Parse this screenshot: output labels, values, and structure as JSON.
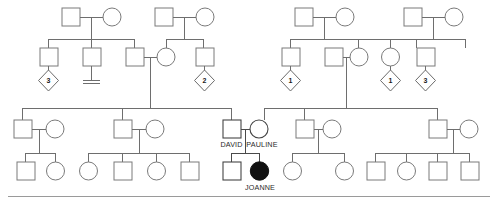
{
  "chart": {
    "type": "pedigree",
    "title": "",
    "width": 498,
    "height": 203,
    "background": "#ffffff",
    "line_color": "#6e6e6e",
    "shape_stroke": "#7a7a7a",
    "affected_fill": "#111111"
  },
  "legend_symbols": {
    "square": "male",
    "circle": "female",
    "diamond": "sibship-of-unspecified-sex",
    "filled_circle": "affected-female",
    "double_bar": "no-offspring"
  },
  "labels": {
    "david": "DAVID",
    "pauline": "PAULINE",
    "joanne": "JOANNE"
  },
  "diamond_counts": {
    "d1": "3",
    "d2": "2",
    "d3": "1",
    "d4": "1",
    "d5": "3"
  },
  "generations": [
    {
      "id": "generation-1",
      "label": "Generation I",
      "couples": [
        {
          "id": "couple-g1-a",
          "male": "square",
          "female": "circle"
        },
        {
          "id": "couple-g1-b",
          "male": "square",
          "female": "circle"
        },
        {
          "id": "couple-g1-c",
          "male": "square",
          "female": "circle"
        },
        {
          "id": "couple-g1-d",
          "male": "square",
          "female": "circle"
        }
      ]
    },
    {
      "id": "generation-2",
      "label": "Generation II",
      "members": [
        {
          "id": "g2-m1",
          "shape": "square",
          "offspring_marker": "diamond-3"
        },
        {
          "id": "g2-m2",
          "shape": "square",
          "offspring_marker": "no-offspring-bar"
        },
        {
          "id": "g2-m3",
          "shape": "square",
          "offspring_marker": "none"
        },
        {
          "id": "g2-f1",
          "shape": "circle",
          "offspring_marker": "none"
        },
        {
          "id": "g2-m4",
          "shape": "square",
          "offspring_marker": "diamond-2"
        },
        {
          "id": "g2-m5",
          "shape": "square",
          "offspring_marker": "diamond-1"
        },
        {
          "id": "g2-m6",
          "shape": "square",
          "offspring_marker": "none"
        },
        {
          "id": "g2-f2",
          "shape": "circle",
          "offspring_marker": "none"
        },
        {
          "id": "g2-f3",
          "shape": "circle",
          "offspring_marker": "diamond-1"
        },
        {
          "id": "g2-m7",
          "shape": "square",
          "offspring_marker": "diamond-3"
        }
      ]
    },
    {
      "id": "generation-3",
      "label": "Generation III",
      "couples": [
        {
          "id": "couple-g3-a",
          "male": "square",
          "female": "circle"
        },
        {
          "id": "couple-g3-b",
          "male": "square",
          "female": "circle"
        },
        {
          "id": "couple-g3-c",
          "male": "square",
          "female": "circle",
          "male_name": "DAVID",
          "female_name": "PAULINE"
        },
        {
          "id": "couple-g3-d",
          "male": "square",
          "female": "circle"
        },
        {
          "id": "couple-g3-e",
          "male": "square",
          "female": "circle"
        }
      ]
    },
    {
      "id": "generation-4",
      "label": "Generation IV",
      "members": [
        {
          "id": "g4-1",
          "shape": "square",
          "affected": false
        },
        {
          "id": "g4-2",
          "shape": "circle",
          "affected": false
        },
        {
          "id": "g4-3",
          "shape": "circle",
          "affected": false
        },
        {
          "id": "g4-4",
          "shape": "square",
          "affected": false
        },
        {
          "id": "g4-5",
          "shape": "circle",
          "affected": false
        },
        {
          "id": "g4-6",
          "shape": "square",
          "affected": false
        },
        {
          "id": "g4-7",
          "shape": "square",
          "affected": false
        },
        {
          "id": "g4-8",
          "shape": "circle",
          "affected": true,
          "name": "JOANNE"
        },
        {
          "id": "g4-9",
          "shape": "circle",
          "affected": false
        },
        {
          "id": "g4-10",
          "shape": "circle",
          "affected": false
        },
        {
          "id": "g4-11",
          "shape": "square",
          "affected": false
        },
        {
          "id": "g4-12",
          "shape": "circle",
          "affected": false
        },
        {
          "id": "g4-13",
          "shape": "square",
          "affected": false
        },
        {
          "id": "g4-14",
          "shape": "square",
          "affected": false
        }
      ]
    }
  ]
}
